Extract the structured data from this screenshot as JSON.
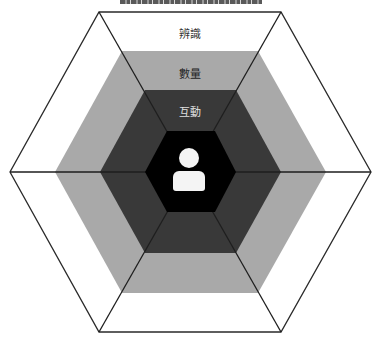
{
  "diagram": {
    "type": "nested-hexagon",
    "layers": [
      {
        "name": "outer",
        "label": "辨識",
        "fill": "#ffffff"
      },
      {
        "name": "middle",
        "label": "數量",
        "fill": "#a9a9a9"
      },
      {
        "name": "inner",
        "label": "互動",
        "fill": "#393939"
      },
      {
        "name": "core",
        "label": "",
        "fill": "#000000",
        "icon": "user-icon"
      }
    ],
    "colors": {
      "stroke": "#2a2a2a",
      "label_outer": "#333333",
      "label_middle": "#222222",
      "label_inner": "#e0e0e0",
      "icon": "#f4f4f4"
    }
  }
}
